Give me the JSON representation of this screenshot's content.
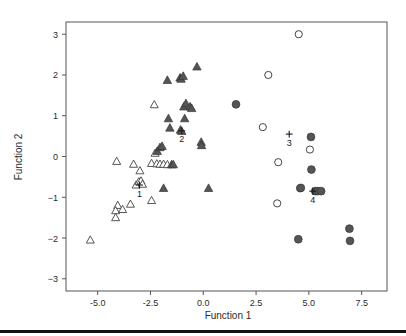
{
  "figure": {
    "background": "#ffffff",
    "frame_color": "#555555",
    "bottom_rule_color": "#111111"
  },
  "chart_data": {
    "type": "scatter",
    "title": "",
    "xlabel": "Function 1",
    "ylabel": "Function 2",
    "xlim": [
      -6.5,
      8.7
    ],
    "ylim": [
      -3.3,
      3.3
    ],
    "xticks": [
      "-5.0",
      "-2.5",
      "0.0",
      "2.5",
      "5.0",
      "7.5"
    ],
    "xtick_values": [
      -5.0,
      -2.5,
      0.0,
      2.5,
      5.0,
      7.5
    ],
    "yticks": [
      "3",
      "2",
      "1",
      "0",
      "-1",
      "-2",
      "-3"
    ],
    "ytick_values": [
      3,
      2,
      1,
      0,
      -1,
      -2,
      -3
    ],
    "grid": false,
    "legend": "none",
    "marker_colors": {
      "open_triangle": "#ffffff",
      "filled_triangle": "#555555",
      "open_circle": "#ffffff",
      "filled_circle": "#555555",
      "outline": "#444444",
      "centroid": "#1a1a1a"
    },
    "series": [
      {
        "name": "1",
        "marker": "open-triangle",
        "fill": "#ffffff",
        "stroke": "#444444",
        "points": [
          [
            -5.35,
            -2.05
          ],
          [
            -4.1,
            -0.12
          ],
          [
            -4.05,
            -1.2
          ],
          [
            -4.15,
            -1.33
          ],
          [
            -4.15,
            -1.5
          ],
          [
            -3.82,
            -1.3
          ],
          [
            -3.45,
            -1.17
          ],
          [
            -3.3,
            -0.19
          ],
          [
            -3.18,
            -0.7
          ],
          [
            -3.05,
            -0.62
          ],
          [
            -3.0,
            -0.35
          ],
          [
            -2.95,
            -0.6
          ],
          [
            -2.88,
            -0.68
          ],
          [
            -2.45,
            -0.17
          ],
          [
            -2.45,
            -1.08
          ],
          [
            -2.32,
            1.27
          ],
          [
            -2.28,
            0.08
          ],
          [
            -2.2,
            -0.18
          ],
          [
            -2.05,
            -0.19
          ],
          [
            -1.88,
            -0.19
          ],
          [
            -1.7,
            -0.2
          ]
        ]
      },
      {
        "name": "2",
        "marker": "filled-triangle",
        "fill": "#555555",
        "stroke": "#333333",
        "points": [
          [
            -2.18,
            0.13
          ],
          [
            -2.05,
            0.22
          ],
          [
            -1.95,
            0.25
          ],
          [
            -1.88,
            -0.78
          ],
          [
            -1.7,
            1.87
          ],
          [
            -1.65,
            0.93
          ],
          [
            -1.58,
            0.7
          ],
          [
            -1.5,
            -0.2
          ],
          [
            -1.42,
            -0.2
          ],
          [
            -1.1,
            1.93
          ],
          [
            -1.05,
            1.9
          ],
          [
            -0.95,
            1.97
          ],
          [
            -0.92,
            1.22
          ],
          [
            -0.88,
            0.93
          ],
          [
            -1.08,
            0.65
          ],
          [
            -1.02,
            0.62
          ],
          [
            -0.82,
            1.3
          ],
          [
            -0.62,
            1.22
          ],
          [
            -0.55,
            1.18
          ],
          [
            -0.3,
            2.2
          ],
          [
            -0.1,
            0.35
          ],
          [
            -0.08,
            0.27
          ],
          [
            0.25,
            -0.78
          ]
        ]
      },
      {
        "name": "3",
        "marker": "open-circle",
        "fill": "#ffffff",
        "stroke": "#444444",
        "points": [
          [
            3.08,
            2.0
          ],
          [
            2.82,
            0.72
          ],
          [
            3.55,
            -0.14
          ],
          [
            3.5,
            -1.15
          ],
          [
            4.52,
            3.0
          ],
          [
            4.58,
            -0.78
          ],
          [
            5.05,
            0.17
          ]
        ]
      },
      {
        "name": "4",
        "marker": "filled-circle",
        "fill": "#555555",
        "stroke": "#333333",
        "points": [
          [
            1.55,
            1.28
          ],
          [
            4.5,
            -2.03
          ],
          [
            4.62,
            -0.77
          ],
          [
            5.1,
            0.48
          ],
          [
            5.12,
            -0.32
          ],
          [
            5.3,
            -0.85
          ],
          [
            5.42,
            -0.85
          ],
          [
            5.58,
            -0.85
          ],
          [
            6.92,
            -1.77
          ],
          [
            6.95,
            -2.07
          ]
        ]
      }
    ],
    "centroids": [
      {
        "label": "1",
        "x": -3.02,
        "y": -0.7,
        "marker": "plus"
      },
      {
        "label": "2",
        "x": -1.02,
        "y": 0.63,
        "marker": "plus"
      },
      {
        "label": "3",
        "x": 4.07,
        "y": 0.55,
        "marker": "plus"
      },
      {
        "label": "4",
        "x": 5.18,
        "y": -0.85,
        "marker": "plus"
      }
    ]
  }
}
